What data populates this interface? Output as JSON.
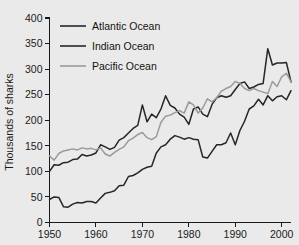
{
  "chart_data": {
    "type": "line",
    "title": "",
    "xlabel": "",
    "ylabel": "Thousands of sharks",
    "xlim": [
      1950,
      2002
    ],
    "ylim": [
      0,
      400
    ],
    "y_ticks": [
      0,
      50,
      100,
      150,
      200,
      250,
      300,
      350,
      400
    ],
    "y_tick_labels": [
      "0",
      "50",
      "100",
      "150",
      "200",
      "250",
      "300",
      "350",
      "400"
    ],
    "x_ticks": [
      1950,
      1960,
      1970,
      1980,
      1990,
      2000
    ],
    "x_tick_labels": [
      "1950",
      "1960",
      "1970",
      "1980",
      "1990",
      "2000"
    ],
    "grid": false,
    "legend_position": "top-left",
    "x": [
      1950,
      1951,
      1952,
      1953,
      1954,
      1955,
      1956,
      1957,
      1958,
      1959,
      1960,
      1961,
      1962,
      1963,
      1964,
      1965,
      1966,
      1967,
      1968,
      1969,
      1970,
      1971,
      1972,
      1973,
      1974,
      1975,
      1976,
      1977,
      1978,
      1979,
      1980,
      1981,
      1982,
      1983,
      1984,
      1985,
      1986,
      1987,
      1988,
      1989,
      1990,
      1991,
      1992,
      1993,
      1994,
      1995,
      1996,
      1997,
      1998,
      1999,
      2000,
      2001,
      2002
    ],
    "series": [
      {
        "name": "Atlantic Ocean",
        "color": "#262626",
        "values": [
          100,
          113,
          112,
          117,
          118,
          123,
          124,
          133,
          130,
          132,
          136,
          152,
          148,
          143,
          147,
          161,
          166,
          175,
          184,
          190,
          230,
          197,
          212,
          205,
          222,
          248,
          229,
          224,
          212,
          206,
          192,
          222,
          226,
          212,
          207,
          231,
          244,
          248,
          245,
          248,
          260,
          272,
          275,
          262,
          265,
          270,
          272,
          340,
          308,
          312,
          312,
          313,
          275
        ]
      },
      {
        "name": "Indian Ocean",
        "color": "#262626",
        "values": [
          45,
          50,
          49,
          31,
          30,
          36,
          39,
          38,
          41,
          41,
          38,
          48,
          57,
          59,
          62,
          72,
          73,
          90,
          92,
          97,
          104,
          108,
          110,
          136,
          148,
          152,
          163,
          170,
          167,
          163,
          166,
          163,
          162,
          128,
          126,
          139,
          152,
          152,
          156,
          175,
          152,
          180,
          198,
          222,
          228,
          241,
          230,
          248,
          238,
          246,
          248,
          240,
          258
        ]
      },
      {
        "name": "Pacific Ocean",
        "color": "#9a9a9a",
        "values": [
          130,
          122,
          135,
          140,
          142,
          144,
          142,
          146,
          144,
          145,
          142,
          146,
          134,
          130,
          137,
          143,
          148,
          160,
          165,
          172,
          176,
          166,
          162,
          168,
          196,
          208,
          210,
          215,
          219,
          214,
          236,
          230,
          214,
          224,
          242,
          236,
          244,
          257,
          262,
          266,
          276,
          272,
          262,
          258,
          262,
          258,
          255,
          252,
          276,
          266,
          285,
          292,
          275
        ]
      }
    ]
  },
  "legend": {
    "items": [
      {
        "label": "Atlantic Ocean"
      },
      {
        "label": "Indian Ocean"
      },
      {
        "label": "Pacific Ocean"
      }
    ]
  },
  "axes": {
    "y_title": "Thousands of sharks"
  }
}
